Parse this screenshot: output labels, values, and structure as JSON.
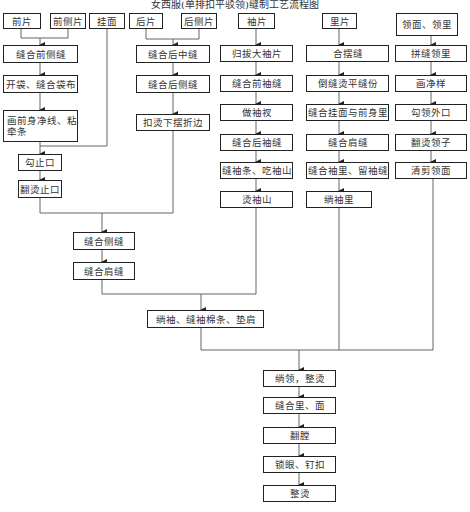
{
  "title": "女西服(单排扣平驳领)缝制工艺流程图",
  "inputs": {
    "front": "前片",
    "front_side": "前侧片",
    "facing": "挂面",
    "back": "后片",
    "back_side": "后侧片",
    "sleeve": "袖片",
    "lining": "里片",
    "collar": "领面、领里"
  },
  "front_column": [
    "缝合前侧缝",
    "开袋、缝合袋布",
    "画前身净线、粘牵条",
    "勾止口",
    "翻烫止口"
  ],
  "back_column": [
    "缝合后中缝",
    "缝合后侧缝",
    "扣烫下摆折边"
  ],
  "sleeve_column": [
    "归拔大袖片",
    "缝合前袖缝",
    "做袖衩",
    "缝合后袖缝",
    "缝袖条、吃袖山",
    "烫袖山"
  ],
  "lining_column": [
    "合摆缝",
    "倒缝烫平缝份",
    "缝合挂面与前身里",
    "缝合肩缝",
    "缝合袖里、留袖缝",
    "绱袖里"
  ],
  "collar_column": [
    "拼缝领里",
    "画净样",
    "勾领外口",
    "翻烫领子",
    "清剪领面"
  ],
  "body_assembly": [
    "缝合侧缝",
    "缝合肩缝"
  ],
  "sleeve_assembly": "绱袖、缝袖棉条、垫肩",
  "final_column": [
    "绱领，整烫",
    "缝合里、面",
    "翻膛",
    "锁眼、钉扣",
    "整烫"
  ]
}
